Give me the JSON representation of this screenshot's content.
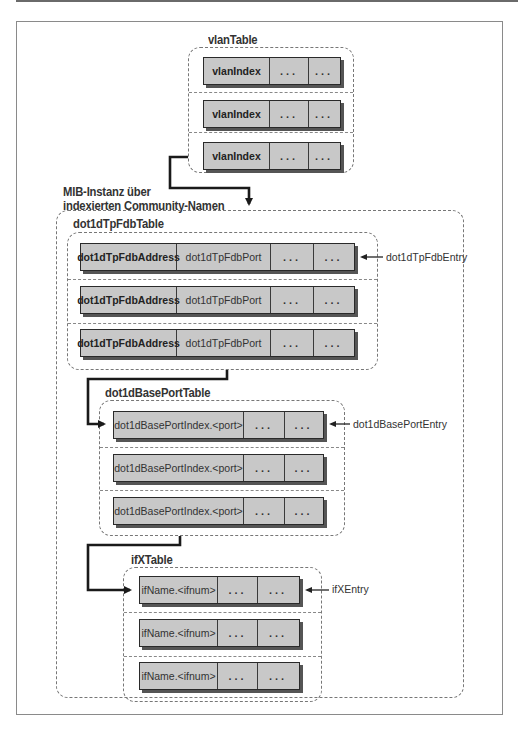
{
  "diagram": {
    "callout": {
      "line1": "MIB-Instanz über",
      "line2": "indexierten Community-Namen"
    },
    "tables": [
      {
        "name": "vlanTable",
        "rows": [
          [
            "vlanIndex",
            "...",
            "..."
          ],
          [
            "vlanIndex",
            "...",
            "..."
          ],
          [
            "vlanIndex",
            "...",
            "..."
          ]
        ]
      },
      {
        "name": "dot1dTpFdbTable",
        "entry_label": "dot1dTpFdbEntry",
        "rows": [
          [
            "dot1dTpFdbAddress",
            "dot1dTpFdbPort",
            "...",
            "..."
          ],
          [
            "dot1dTpFdbAddress",
            "dot1dTpFdbPort",
            "...",
            "..."
          ],
          [
            "dot1dTpFdbAddress",
            "dot1dTpFdbPort",
            "...",
            "..."
          ]
        ]
      },
      {
        "name": "dot1dBasePortTable",
        "entry_label": "dot1dBasePortEntry",
        "rows": [
          [
            "dot1dBasePortIndex.<port>",
            "...",
            "..."
          ],
          [
            "dot1dBasePortIndex.<port>",
            "...",
            "..."
          ],
          [
            "dot1dBasePortIndex.<port>",
            "...",
            "..."
          ]
        ]
      },
      {
        "name": "ifXTable",
        "entry_label": "ifXEntry",
        "rows": [
          [
            "ifName.<ifnum>",
            "...",
            "..."
          ],
          [
            "ifName.<ifnum>",
            "...",
            "..."
          ],
          [
            "ifName.<ifnum>",
            "...",
            "..."
          ]
        ]
      }
    ],
    "colors": {
      "cell_fill": "#c8c8c8",
      "cell_border": "#2a2a2a",
      "connector": "#1a1a1a",
      "dashed_border": "#777777"
    }
  }
}
